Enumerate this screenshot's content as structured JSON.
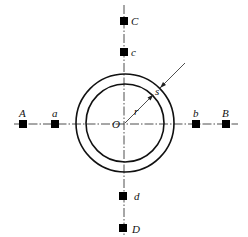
{
  "diagram": {
    "type": "pipe cross-section with measurement points",
    "center_label": "O",
    "radius_label": "r",
    "thickness_label": "s",
    "points": [
      {
        "id": "A",
        "label": "A",
        "axis": "horizontal",
        "side": "left",
        "order": "outer"
      },
      {
        "id": "a",
        "label": "a",
        "axis": "horizontal",
        "side": "left",
        "order": "inner"
      },
      {
        "id": "b",
        "label": "b",
        "axis": "horizontal",
        "side": "right",
        "order": "inner"
      },
      {
        "id": "B",
        "label": "B",
        "axis": "horizontal",
        "side": "right",
        "order": "outer"
      },
      {
        "id": "C",
        "label": "C",
        "axis": "vertical",
        "side": "top",
        "order": "outer"
      },
      {
        "id": "c",
        "label": "c",
        "axis": "vertical",
        "side": "top",
        "order": "inner"
      },
      {
        "id": "d",
        "label": "d",
        "axis": "vertical",
        "side": "bottom",
        "order": "inner"
      },
      {
        "id": "D",
        "label": "D",
        "axis": "vertical",
        "side": "bottom",
        "order": "outer"
      }
    ],
    "colors": {
      "line": "#222222",
      "marker": "#000000",
      "background": "#ffffff"
    }
  }
}
